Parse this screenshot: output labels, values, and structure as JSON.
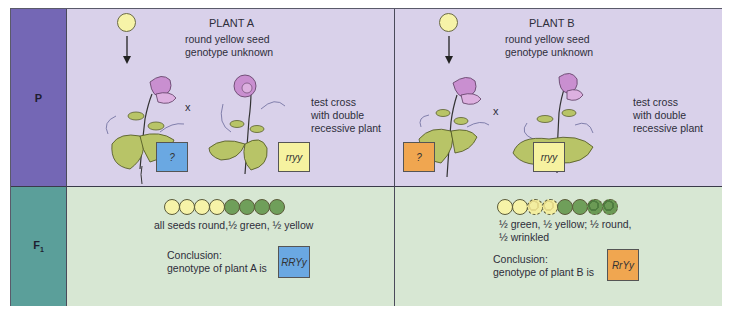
{
  "row_labels": {
    "parent": "P",
    "f1": "F",
    "f1_sub": "1"
  },
  "colors": {
    "p_label_bg": "#7467b5",
    "f1_label_bg": "#5b9f9a",
    "p_row_bg": "#d9d1ea",
    "f1_row_bg": "#d7e7d3",
    "unknown_a_box": "#6aa8e2",
    "unknown_b_box": "#f0a650",
    "recessive_box": "#f6f2a0",
    "yellow_seed": "#f6f3a8",
    "green_seed": "#6f9f5a",
    "flower": "#c98fd0",
    "leaf": "#b8c467"
  },
  "plant_a": {
    "title": "PLANT A",
    "desc_line1": "round yellow seed",
    "desc_line2": "genotype unknown",
    "cross_symbol": "x",
    "test_line1": "test cross",
    "test_line2": "with double",
    "test_line3": "recessive plant",
    "unknown_box": "?",
    "recessive_box": "rryy",
    "f1_seeds": [
      "yellow-round",
      "yellow-round",
      "yellow-round",
      "yellow-round",
      "green-round",
      "green-round",
      "green-round",
      "green-round"
    ],
    "f1_result": "all seeds round,½ green, ½ yellow",
    "conclusion_line1": "Conclusion:",
    "conclusion_line2": "genotype of plant A is",
    "genotype": "RRYy"
  },
  "plant_b": {
    "title": "PLANT B",
    "desc_line1": "round yellow seed",
    "desc_line2": "genotype unknown",
    "cross_symbol": "x",
    "test_line1": "test cross",
    "test_line2": "with double",
    "test_line3": "recessive plant",
    "unknown_box": "?",
    "recessive_box": "rryy",
    "f1_seeds": [
      "yellow-round",
      "yellow-round",
      "yellow-wrinkled",
      "yellow-wrinkled",
      "green-round",
      "green-round",
      "green-wrinkled",
      "green-wrinkled"
    ],
    "f1_result_line1": "½ green, ½ yellow; ½ round,",
    "f1_result_line2": "½ wrinkled",
    "conclusion_line1": "Conclusion:",
    "conclusion_line2": "genotype of plant B is",
    "genotype": "RrYy"
  }
}
